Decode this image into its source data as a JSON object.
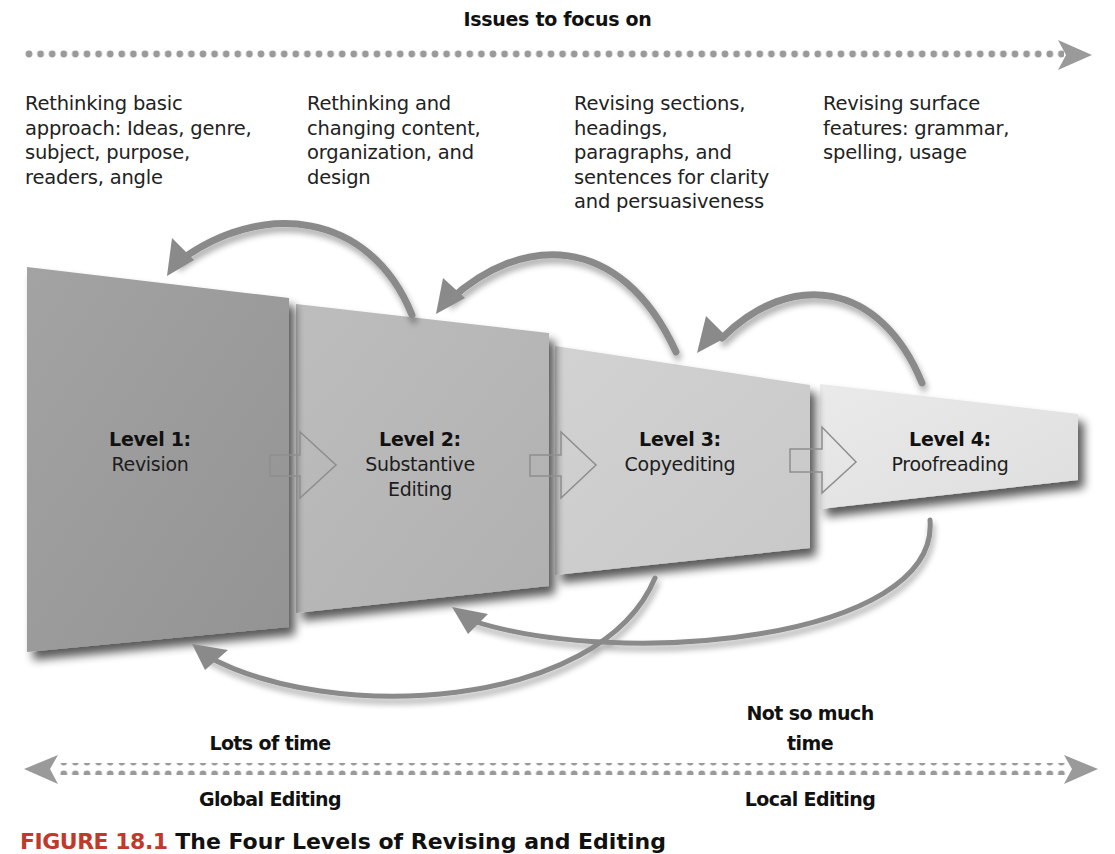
{
  "top_axis": {
    "title": "Issues to focus on",
    "direction": "right",
    "style": "dotted-arrow",
    "color": "#9a9a9a"
  },
  "issues": [
    {
      "level": 1,
      "text_lines": [
        "Rethinking basic",
        "approach: Ideas, genre,",
        "subject, purpose,",
        "readers, angle"
      ]
    },
    {
      "level": 2,
      "text_lines": [
        "Rethinking and",
        "changing content,",
        "organization, and",
        "design"
      ]
    },
    {
      "level": 3,
      "text_lines": [
        "Revising sections,",
        "headings,",
        "paragraphs, and",
        "sentences for clarity",
        "and persuasiveness"
      ]
    },
    {
      "level": 4,
      "text_lines": [
        "Revising surface",
        "features: grammar,",
        "spelling, usage"
      ]
    }
  ],
  "levels": [
    {
      "id": 1,
      "title": "Level 1:",
      "name_lines": [
        "Revision"
      ],
      "fill": "#9d9d9d"
    },
    {
      "id": 2,
      "title": "Level 2:",
      "name_lines": [
        "Substantive",
        "Editing"
      ],
      "fill": "#b8b8b8"
    },
    {
      "id": 3,
      "title": "Level 3:",
      "name_lines": [
        "Copyediting"
      ],
      "fill": "#cfcfcf"
    },
    {
      "id": 4,
      "title": "Level 4:",
      "name_lines": [
        "Proofreading"
      ],
      "fill": "#e6e6e6"
    }
  ],
  "flow_arrows": [
    {
      "from": 1,
      "to": 2,
      "style": "outline-arrow"
    },
    {
      "from": 2,
      "to": 3,
      "style": "outline-arrow"
    },
    {
      "from": 3,
      "to": 4,
      "style": "outline-arrow"
    }
  ],
  "return_arrows": {
    "top": [
      {
        "from": 2,
        "to": 1
      },
      {
        "from": 3,
        "to": 2
      },
      {
        "from": 4,
        "to": 3
      }
    ],
    "bottom": [
      {
        "from": 3,
        "to": 1
      },
      {
        "from": 4,
        "to": 2
      }
    ],
    "color": "#8a8a8a"
  },
  "time_labels": {
    "left": "Lots of time",
    "right_lines": [
      "Not so much",
      "time"
    ]
  },
  "bottom_axis": {
    "direction": "both",
    "left_label": "Global Editing",
    "right_label": "Local Editing",
    "color": "#9a9a9a"
  },
  "caption": {
    "figure_number": "FIGURE 18.1",
    "title": "The Four Levels of Revising and Editing"
  }
}
